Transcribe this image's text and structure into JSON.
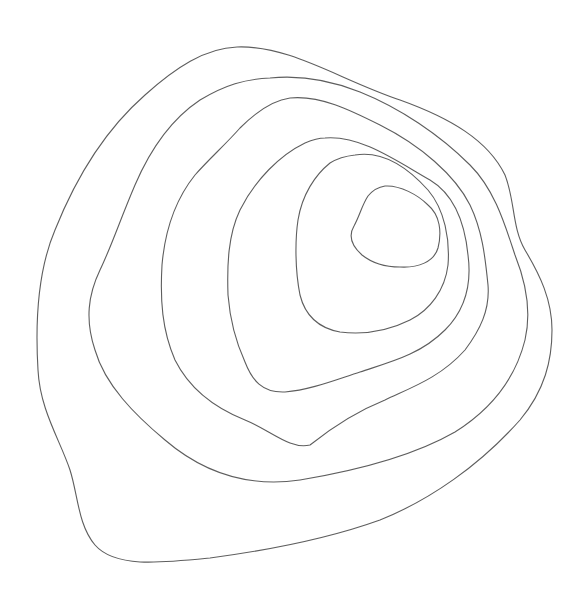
{
  "diagram": {
    "type": "contour-lines",
    "background": "#ffffff",
    "stroke_color": "#5e5e5e",
    "contour_count": 6,
    "contours": [
      {
        "id": "contour-1-outer",
        "path": "M237,47 C290,45 340,80 400,100 C450,118 488,140 505,175 C515,200 512,228 525,250 C540,275 552,300 552,330 C552,360 545,390 520,420 C480,465 430,500 380,520 C330,538 270,550 210,558 C160,563 115,568 95,545 C78,525 78,495 70,470 C60,440 40,410 38,370 C35,320 38,270 55,230 C75,180 105,130 145,95 C175,68 205,48 237,47 Z"
      },
      {
        "id": "contour-2",
        "path": "M270,78 C300,75 330,80 360,92 C400,108 440,135 470,165 C495,190 505,225 515,255 C525,280 532,310 525,340 C515,380 490,410 455,432 C415,455 360,470 300,480 C245,488 200,470 165,440 C135,415 105,385 95,350 C85,320 88,295 100,270 C112,245 120,220 135,185 C150,150 170,120 200,100 C225,85 245,79 270,78 Z"
      },
      {
        "id": "contour-3",
        "path": "M290,98 C320,95 350,110 380,125 C420,145 455,175 470,205 C482,230 485,255 488,285 C490,310 480,330 465,350 C440,378 410,388 385,400 C360,410 335,425 310,445 C290,450 270,430 245,420 C215,408 190,390 175,360 C162,330 160,300 162,265 C165,230 175,200 195,175 C210,158 225,145 240,128 C260,108 275,100 290,98 Z"
      },
      {
        "id": "contour-4",
        "path": "M325,138 C360,135 395,160 430,180 C455,195 465,225 468,255 C472,285 465,310 445,330 C420,355 390,362 360,372 C335,380 310,390 285,392 C262,393 252,380 245,362 C235,340 230,320 228,295 C227,265 228,235 240,210 C255,180 280,155 305,143 C312,140 318,138 325,138 Z"
      },
      {
        "id": "contour-5",
        "path": "M355,155 C385,150 410,170 428,190 C445,210 450,240 448,265 C445,290 430,310 410,320 C390,330 365,335 340,332 C318,328 305,315 300,295 C295,270 295,240 298,220 C302,195 315,175 330,163 C338,158 346,156 355,155 Z"
      },
      {
        "id": "contour-6-inner",
        "path": "M385,186 C400,185 418,195 428,205 C440,215 442,232 438,248 C434,262 418,268 400,267 C385,267 372,263 362,255 C352,246 348,236 354,226 C360,215 362,205 368,196 C373,190 378,187 385,186 Z"
      }
    ]
  }
}
